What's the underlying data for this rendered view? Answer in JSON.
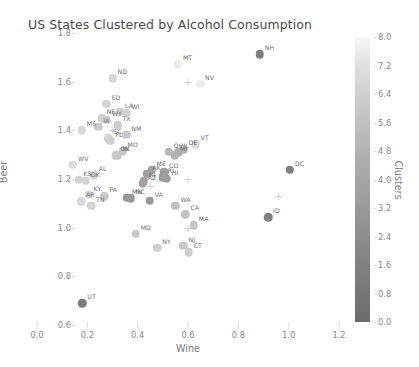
{
  "chart_data": {
    "type": "scatter",
    "title": "US States Clustered by Alcohol Consumption",
    "xlabel": "Wine",
    "ylabel": "Beer",
    "xlim": [
      0.0,
      1.2
    ],
    "ylim": [
      0.6,
      1.8
    ],
    "xticks": [
      "0.0",
      "0.2",
      "0.4",
      "0.6",
      "0.8",
      "1.0",
      "1.2"
    ],
    "yticks": [
      "0.6",
      "0.8",
      "1.0",
      "1.2",
      "1.4",
      "1.6",
      "1.8"
    ],
    "grid": false,
    "colorbar": {
      "label": "Clusters",
      "ticks": [
        "0.0",
        "0.8",
        "1.6",
        "2.4",
        "3.2",
        "4.0",
        "4.8",
        "5.6",
        "6.4",
        "7.2",
        "8.0"
      ],
      "vmin": 0.0,
      "vmax": 8.0,
      "low_color": "#f7f7f7",
      "high_color": "#6b6b6b",
      "orientation": "vertical",
      "position": "right"
    },
    "point_label_field": "state",
    "points": [
      {
        "state": "NH",
        "x": 0.885,
        "y": 1.712,
        "cluster": 6.6
      },
      {
        "state": "MT",
        "x": 0.56,
        "y": 1.672,
        "cluster": 0.3
      },
      {
        "state": "ND",
        "x": 0.3,
        "y": 1.615,
        "cluster": 1.2
      },
      {
        "state": "NV",
        "x": 0.648,
        "y": 1.592,
        "cluster": 0.3
      },
      {
        "state": "SD",
        "x": 0.276,
        "y": 1.51,
        "cluster": 1.3
      },
      {
        "state": "LA",
        "x": 0.33,
        "y": 1.477,
        "cluster": 1.5
      },
      {
        "state": "WI",
        "x": 0.356,
        "y": 1.472,
        "cluster": 1.5
      },
      {
        "state": "NE",
        "x": 0.257,
        "y": 1.45,
        "cluster": 1.6
      },
      {
        "state": "WY",
        "x": 0.278,
        "y": 1.443,
        "cluster": 1.8
      },
      {
        "state": "IA",
        "x": 0.243,
        "y": 1.415,
        "cluster": 1.8
      },
      {
        "state": "TX",
        "x": 0.32,
        "y": 1.421,
        "cluster": 1.7
      },
      {
        "state": "MS",
        "x": 0.178,
        "y": 1.4,
        "cluster": 1.1
      },
      {
        "state": "NM",
        "x": 0.355,
        "y": 1.382,
        "cluster": 1.9
      },
      {
        "state": "SC",
        "x": 0.283,
        "y": 1.368,
        "cluster": 1.4
      },
      {
        "state": "FL",
        "x": 0.292,
        "y": 1.357,
        "cluster": 1.6
      },
      {
        "state": "VT",
        "x": 0.63,
        "y": 1.343,
        "cluster": 1.1
      },
      {
        "state": "MO",
        "x": 0.34,
        "y": 1.315,
        "cluster": 2.0
      },
      {
        "state": "OK",
        "x": 0.312,
        "y": 1.297,
        "cluster": 1.9
      },
      {
        "state": "IN",
        "x": 0.32,
        "y": 1.297,
        "cluster": 2.0
      },
      {
        "state": "OH",
        "x": 0.524,
        "y": 1.312,
        "cluster": 3.0
      },
      {
        "state": "IL",
        "x": 0.562,
        "y": 1.31,
        "cluster": 3.5
      },
      {
        "state": "DE",
        "x": 0.583,
        "y": 1.322,
        "cluster": 3.2
      },
      {
        "state": "MI",
        "x": 0.548,
        "y": 1.298,
        "cluster": 3.2
      },
      {
        "state": "WV",
        "x": 0.143,
        "y": 1.258,
        "cluster": 1.0
      },
      {
        "state": "DC",
        "x": 1.005,
        "y": 1.237,
        "cluster": 6.5
      },
      {
        "state": "ME",
        "x": 0.455,
        "y": 1.238,
        "cluster": 4.2
      },
      {
        "state": "CO",
        "x": 0.505,
        "y": 1.228,
        "cluster": 4.5
      },
      {
        "state": "AK",
        "x": 0.438,
        "y": 1.222,
        "cluster": 4.5
      },
      {
        "state": "RI",
        "x": 0.5,
        "y": 1.208,
        "cluster": 4.6
      },
      {
        "state": "HI",
        "x": 0.516,
        "y": 1.202,
        "cluster": 4.4
      },
      {
        "state": "AL",
        "x": 0.225,
        "y": 1.215,
        "cluster": 1.5
      },
      {
        "state": "KS",
        "x": 0.165,
        "y": 1.196,
        "cluster": 1.4
      },
      {
        "state": "OK2",
        "x": 0.194,
        "y": 1.192,
        "cluster": 1.4
      },
      {
        "state": "NJ2",
        "x": 0.425,
        "y": 1.19,
        "cluster": 4.3
      },
      {
        "state": "AZ",
        "x": 0.42,
        "y": 1.18,
        "cluster": 4.2
      },
      {
        "state": "MN",
        "x": 0.358,
        "y": 1.122,
        "cluster": 5.0
      },
      {
        "state": "NC",
        "x": 0.372,
        "y": 1.12,
        "cluster": 4.8
      },
      {
        "state": "VA",
        "x": 0.448,
        "y": 1.11,
        "cluster": 4.9
      },
      {
        "state": "KY",
        "x": 0.205,
        "y": 1.135,
        "cluster": 1.3
      },
      {
        "state": "PA",
        "x": 0.268,
        "y": 1.13,
        "cluster": 1.9
      },
      {
        "state": "AR",
        "x": 0.175,
        "y": 1.108,
        "cluster": 1.1
      },
      {
        "state": "TN",
        "x": 0.215,
        "y": 1.09,
        "cluster": 1.4
      },
      {
        "state": "WA",
        "x": 0.55,
        "y": 1.09,
        "cluster": 2.4
      },
      {
        "state": "CA",
        "x": 0.59,
        "y": 1.055,
        "cluster": 2.2
      },
      {
        "state": "ID",
        "x": 0.918,
        "y": 1.043,
        "cluster": 6.4
      },
      {
        "state": "MA",
        "x": 0.623,
        "y": 1.01,
        "cluster": 2.1
      },
      {
        "state": "MD",
        "x": 0.392,
        "y": 0.975,
        "cluster": 1.9
      },
      {
        "state": "NY",
        "x": 0.478,
        "y": 0.918,
        "cluster": 1.6
      },
      {
        "state": "NJ",
        "x": 0.582,
        "y": 0.925,
        "cluster": 1.9
      },
      {
        "state": "CT",
        "x": 0.603,
        "y": 0.898,
        "cluster": 1.7
      },
      {
        "state": "UT",
        "x": 0.18,
        "y": 0.69,
        "cluster": 6.8
      }
    ]
  },
  "labels": {
    "NH": "NH",
    "MT": "MT",
    "ND": "ND",
    "NV": "NV",
    "SD": "SD",
    "LA": "LA",
    "WI": "WI",
    "NE": "NE",
    "WY": "WY",
    "IA": "IA",
    "TX": "TX",
    "MS": "MS",
    "NM": "NM",
    "SC": "SC",
    "FL": "FL",
    "VT": "VT",
    "MO": "MO",
    "OK": "OK",
    "IN": "IN",
    "OH": "OH",
    "IL": "IL",
    "DE": "DE",
    "MI": "MI",
    "WV": "WV",
    "DC": "DC",
    "ME": "ME",
    "CO": "CO",
    "AK": "AK",
    "RI": "RI",
    "HI": "HI",
    "AL": "AL",
    "KS": "KS",
    "OK2": "OK",
    "NJ2": "NJ",
    "AZ": "AZ",
    "MN": "MN",
    "NC": "NC",
    "VA": "VA",
    "KY": "KY",
    "PA": "PA",
    "AR": "AR",
    "TN": "TN",
    "WA": "WA",
    "CA": "CA",
    "ID": "ID",
    "MA": "MA",
    "MD": "MD",
    "NY": "NY",
    "NJ": "NJ",
    "CT": "CT",
    "UT": "UT"
  }
}
